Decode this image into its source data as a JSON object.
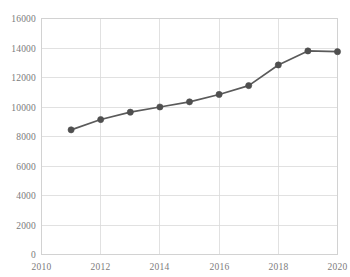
{
  "chart_data": {
    "type": "line",
    "title": "",
    "subtitle": "",
    "xlabel": "",
    "ylabel": "",
    "x": [
      2011,
      2012,
      2013,
      2014,
      2015,
      2016,
      2017,
      2018,
      2019,
      2020
    ],
    "values": [
      8450,
      9150,
      9650,
      10000,
      10350,
      10850,
      11450,
      12850,
      13800,
      13750
    ],
    "series": [
      {
        "name": "series-1",
        "values": [
          8450,
          9150,
          9650,
          10000,
          10350,
          10850,
          11450,
          12850,
          13800,
          13750
        ],
        "color": "#5a5a5a",
        "marker": "circle"
      }
    ],
    "xlim": [
      2010,
      2020
    ],
    "ylim": [
      0,
      16000
    ],
    "xticks": [
      2010,
      2012,
      2014,
      2016,
      2018,
      2020
    ],
    "xtick_labels": [
      "2010",
      "2012",
      "2014",
      "2016",
      "2018",
      "2020"
    ],
    "yticks": [
      0,
      2000,
      4000,
      6000,
      8000,
      10000,
      12000,
      14000,
      16000
    ],
    "ytick_labels": [
      "0",
      "2000",
      "4000",
      "6000",
      "8000",
      "10000",
      "12000",
      "14000",
      "16000"
    ],
    "grid": {
      "horizontal": true,
      "vertical": true,
      "color": "#d9d9d9"
    },
    "legend": {
      "visible": false,
      "position": "none",
      "entries": []
    },
    "annotations": [],
    "colors": {
      "line": "#5a5a5a",
      "marker": "#4f4f4f",
      "grid": "#d9d9d9",
      "axis_text": "#7b7b7b",
      "border": "#d2d2d2",
      "background": "#ffffff"
    }
  }
}
